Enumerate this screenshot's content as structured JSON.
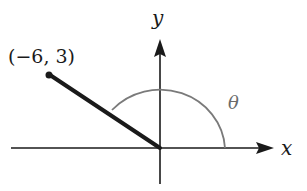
{
  "diagram": {
    "type": "angle-in-standard-position",
    "axes": {
      "x_label": "x",
      "y_label": "y"
    },
    "point": {
      "label": "(−6, 3)",
      "x": -6,
      "y": 3
    },
    "angle": {
      "label": "θ",
      "description": "arc from positive x-axis counterclockwise to terminal side"
    },
    "colors": {
      "axes": "#1a1a1a",
      "terminal_side": "#1a1a1a",
      "arc": "#7a7a7a"
    }
  }
}
